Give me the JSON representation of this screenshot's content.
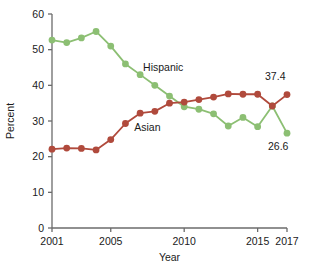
{
  "chart_data": {
    "type": "line",
    "title": "",
    "xlabel": "Year",
    "ylabel": "Percent",
    "xlim": [
      2001,
      2017
    ],
    "ylim": [
      0,
      60
    ],
    "ytick_labels": [
      "0",
      "10",
      "20",
      "30",
      "40",
      "50",
      "60"
    ],
    "yticks": [
      0,
      10,
      20,
      30,
      40,
      50,
      60
    ],
    "xtick_labels": [
      "2001",
      "2005",
      "2010",
      "2015",
      "2017"
    ],
    "xticks": [
      2001,
      2005,
      2010,
      2015,
      2017
    ],
    "grid": false,
    "legend": "inline-labels",
    "x": [
      2001,
      2002,
      2003,
      2004,
      2005,
      2006,
      2007,
      2008,
      2009,
      2010,
      2011,
      2012,
      2013,
      2014,
      2015,
      2016,
      2017
    ],
    "series": [
      {
        "name": "Hispanic",
        "color": "#8cbf73",
        "label_x": 2007.2,
        "label_y": 44.0,
        "values": [
          52.7,
          52.0,
          53.3,
          55.1,
          51.0,
          46.0,
          43.0,
          40.0,
          37.0,
          34.0,
          33.3,
          32.0,
          28.6,
          31.0,
          28.4,
          34.2,
          26.6
        ],
        "end_label": "26.6"
      },
      {
        "name": "Asian",
        "color": "#b04a3c",
        "label_x": 2006.6,
        "label_y": 27.2,
        "values": [
          22.1,
          22.4,
          22.3,
          21.9,
          24.8,
          29.3,
          32.2,
          32.7,
          35.0,
          35.3,
          36.0,
          36.7,
          37.6,
          37.5,
          37.5,
          34.2,
          37.4
        ],
        "end_label": "37.4"
      }
    ],
    "annotations": [
      {
        "name": "asian-end-value",
        "text": "37.4",
        "x": 2016.2,
        "y": 41.5
      },
      {
        "name": "hispanic-end-value",
        "text": "26.6",
        "x": 2016.4,
        "y": 22.0
      }
    ]
  },
  "axis": {
    "y_title": "Percent",
    "x_title": "Year"
  }
}
